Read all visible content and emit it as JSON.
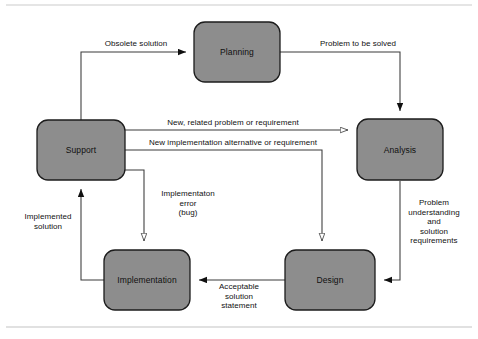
{
  "diagram": {
    "colors": {
      "node_fill": "#8d8d8d",
      "node_stroke": "#1c1c1c",
      "edge_stroke": "#3a3a3a",
      "arrow_solid": "#101010",
      "arrow_hollow_fill": "#ffffff",
      "rule": "#c9c9c9",
      "text": "#111111",
      "background": "#ffffff"
    },
    "nodes": [
      {
        "id": "planning",
        "label": "Planning",
        "x": 237,
        "y": 52,
        "w": 86,
        "h": 60
      },
      {
        "id": "support",
        "label": "Support",
        "x": 81,
        "y": 150,
        "w": 88,
        "h": 60
      },
      {
        "id": "analysis",
        "label": "Analysis",
        "x": 400,
        "y": 150,
        "w": 86,
        "h": 61
      },
      {
        "id": "implementation",
        "label": "Implementation",
        "x": 147,
        "y": 280,
        "w": 86,
        "h": 60
      },
      {
        "id": "design",
        "label": "Design",
        "x": 330,
        "y": 280,
        "w": 90,
        "h": 60
      }
    ],
    "edges": [
      {
        "id": "obsolete-solution",
        "label": "Obsolete solution",
        "from": "support",
        "to": "planning",
        "arrowhead": "solid",
        "label_x": 136,
        "label_y": 44
      },
      {
        "id": "problem-to-be-solved",
        "label": "Problem to be solved",
        "from": "planning",
        "to": "analysis",
        "arrowhead": "solid",
        "label_x": 358,
        "label_y": 44
      },
      {
        "id": "new-related-problem-or-requirement",
        "label": "New, related problem or requirement",
        "from": "support",
        "to": "analysis",
        "arrowhead": "hollow",
        "label_x": 233,
        "label_y": 123
      },
      {
        "id": "new-implementation-alternative-or-requirement",
        "label": "New implementation alternative or requirement",
        "from": "support",
        "to": "design",
        "arrowhead": "hollow",
        "label_x": 233,
        "label_y": 143
      },
      {
        "id": "problem-understanding-and-solution-requirements",
        "label": "Problem\nunderstanding\nand\nsolution\nrequirements",
        "from": "analysis",
        "to": "design",
        "arrowhead": "solid",
        "label_x": 434,
        "label_y": 222
      },
      {
        "id": "acceptable-solution-statement",
        "label": "Acceptable\nsolution\nstatement",
        "from": "design",
        "to": "implementation",
        "arrowhead": "solid",
        "label_x": 239,
        "label_y": 296
      },
      {
        "id": "implementaton-error-bug",
        "label": "Implementaton\nerror\n(bug)",
        "from": "support",
        "to": "implementation",
        "arrowhead": "hollow",
        "label_x": 188,
        "label_y": 203
      },
      {
        "id": "implemented-solution",
        "label": "Implemented\nsolution",
        "from": "implementation",
        "to": "support",
        "arrowhead": "solid",
        "label_x": 48,
        "label_y": 221
      }
    ],
    "rules": [
      {
        "id": "top-rule",
        "y": 5
      },
      {
        "id": "bottom-rule",
        "y": 327
      }
    ]
  }
}
